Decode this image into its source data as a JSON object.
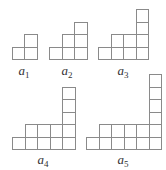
{
  "diagram": {
    "cell_size": 12.5,
    "line_color": "#8a8a8a",
    "figures": [
      {
        "name": "a1",
        "label": "a",
        "subscript": "1",
        "label_pos": [
          24,
          64
        ],
        "origin": [
          11.5,
          59
        ],
        "rows": [
          {
            "start": 0,
            "count": 2
          }
        ],
        "column": {
          "col": 1,
          "height": 1
        }
      },
      {
        "name": "a2",
        "label": "a",
        "subscript": "2",
        "label_pos": [
          67,
          64
        ],
        "origin": [
          49,
          59
        ],
        "rows": [
          {
            "start": 0,
            "count": 3
          },
          {
            "start": 1,
            "count": 2
          }
        ],
        "column": {
          "col": 2,
          "height": 1
        }
      },
      {
        "name": "a3",
        "label": "a",
        "subscript": "3",
        "label_pos": [
          123,
          64
        ],
        "origin": [
          98,
          59
        ],
        "rows": [
          {
            "start": 0,
            "count": 4
          },
          {
            "start": 1,
            "count": 3
          }
        ],
        "column": {
          "col": 3,
          "height": 2
        }
      },
      {
        "name": "a4",
        "label": "a",
        "subscript": "4",
        "label_pos": [
          43,
          153
        ],
        "origin": [
          12,
          149
        ],
        "rows": [
          {
            "start": 0,
            "count": 5
          },
          {
            "start": 1,
            "count": 4
          }
        ],
        "column": {
          "col": 4,
          "height": 3
        }
      },
      {
        "name": "a5",
        "label": "a",
        "subscript": "5",
        "label_pos": [
          123,
          153
        ],
        "origin": [
          86,
          149
        ],
        "rows": [
          {
            "start": 0,
            "count": 6
          },
          {
            "start": 1,
            "count": 5
          }
        ],
        "column": {
          "col": 5,
          "height": 4
        }
      }
    ]
  }
}
